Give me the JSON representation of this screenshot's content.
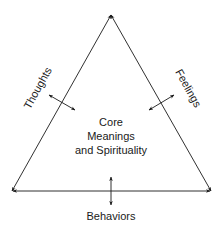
{
  "diagram": {
    "type": "triangle-model",
    "center_text": [
      "Core",
      "Meanings",
      "and Spirituality"
    ],
    "sides": {
      "left": "Thoughts",
      "right": "Feelings",
      "bottom": "Behaviors"
    },
    "colors": {
      "line": "#1a1a1a",
      "text": "#1a1a1a",
      "background": "#ffffff"
    }
  }
}
